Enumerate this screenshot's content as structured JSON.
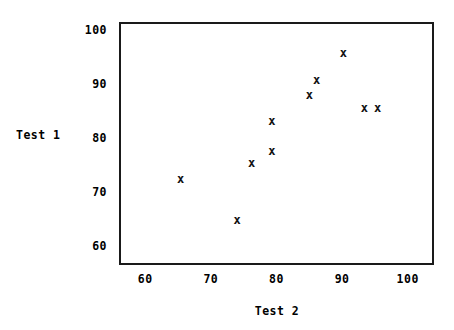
{
  "chart_data": {
    "type": "scatter",
    "title": "",
    "xlabel": "Test 2",
    "ylabel": "Test 1",
    "xlim": [
      56,
      104
    ],
    "ylim": [
      56.5,
      101.5
    ],
    "xticks": [
      60,
      70,
      80,
      90,
      100
    ],
    "yticks": [
      60,
      70,
      80,
      90,
      100
    ],
    "xtick_labels": [
      "60",
      "70",
      "80",
      "90",
      "100"
    ],
    "ytick_labels": [
      "60",
      "70",
      "80",
      "90",
      "100"
    ],
    "grid": false,
    "legend": null,
    "marker": "x",
    "marker_color": "#111111",
    "frame_color": "#1a1a1a",
    "background": "#ffffff",
    "n_points": 10,
    "x": [
      65.4,
      74.0,
      76.2,
      79.3,
      79.3,
      85.0,
      86.1,
      90.2,
      93.4,
      95.4
    ],
    "y": [
      72.4,
      64.8,
      75.3,
      83.0,
      77.6,
      87.9,
      90.6,
      95.6,
      85.5,
      85.5
    ],
    "points": [
      {
        "x": 65.4,
        "y": 72.4,
        "label": "x"
      },
      {
        "x": 74.0,
        "y": 64.8,
        "label": "x"
      },
      {
        "x": 76.2,
        "y": 75.3,
        "label": "x"
      },
      {
        "x": 79.3,
        "y": 83.0,
        "label": "x"
      },
      {
        "x": 79.3,
        "y": 77.6,
        "label": "x"
      },
      {
        "x": 85.0,
        "y": 87.9,
        "label": "x"
      },
      {
        "x": 86.1,
        "y": 90.6,
        "label": "x"
      },
      {
        "x": 90.2,
        "y": 95.6,
        "label": "x"
      },
      {
        "x": 93.4,
        "y": 85.5,
        "label": "x"
      },
      {
        "x": 95.4,
        "y": 85.5,
        "label": "x"
      }
    ]
  }
}
